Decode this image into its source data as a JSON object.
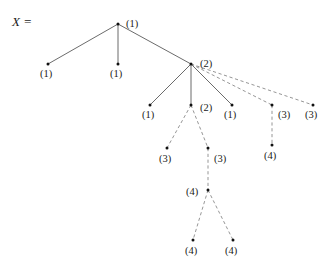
{
  "figure": {
    "equation_label": "X =",
    "background_color": "#ffffff",
    "solid_edge_color": "#5a5a5a",
    "dashed_edge_color": "#8a8a8a",
    "node_dot_color": "#111111",
    "label_color": "#1a1a1a"
  },
  "diagram_data": {
    "type": "tree",
    "description": "Rooted tree with labelled vertices; solid edges and dashed edges",
    "node_labels": [
      "(1)",
      "(1)",
      "(1)",
      "(2)",
      "(1)",
      "(2)",
      "(1)",
      "(3)",
      "(3)",
      "(3)",
      "(3)",
      "(4)",
      "(4)",
      "(4)",
      "(4)"
    ],
    "nodes": [
      {
        "id": "root",
        "label": "(1)",
        "x": 118,
        "y": 24,
        "label_dx": 8,
        "label_dy": 3,
        "depth": 0
      },
      {
        "id": "n1",
        "label": "(1)",
        "x": 48,
        "y": 64,
        "label_dx": -8,
        "label_dy": 13,
        "depth": 1
      },
      {
        "id": "n2",
        "label": "(1)",
        "x": 118,
        "y": 64,
        "label_dx": -8,
        "label_dy": 13,
        "depth": 1
      },
      {
        "id": "n3",
        "label": "(2)",
        "x": 191,
        "y": 64,
        "label_dx": 9,
        "label_dy": 3,
        "depth": 1
      },
      {
        "id": "n4",
        "label": "(1)",
        "x": 150,
        "y": 105,
        "label_dx": -8,
        "label_dy": 13,
        "depth": 2
      },
      {
        "id": "n5",
        "label": "(2)",
        "x": 191,
        "y": 105,
        "label_dx": 9,
        "label_dy": 6,
        "depth": 2
      },
      {
        "id": "n6",
        "label": "(1)",
        "x": 232,
        "y": 105,
        "label_dx": -8,
        "label_dy": 13,
        "depth": 2
      },
      {
        "id": "n7",
        "label": "(3)",
        "x": 272,
        "y": 105,
        "label_dx": 6,
        "label_dy": 13,
        "depth": 2
      },
      {
        "id": "n8",
        "label": "(3)",
        "x": 313,
        "y": 105,
        "label_dx": -8,
        "label_dy": 13,
        "depth": 2
      },
      {
        "id": "n9",
        "label": "(3)",
        "x": 167,
        "y": 148,
        "label_dx": -8,
        "label_dy": 14,
        "depth": 3
      },
      {
        "id": "n10",
        "label": "(3)",
        "x": 208,
        "y": 148,
        "label_dx": 6,
        "label_dy": 14,
        "depth": 3
      },
      {
        "id": "n11",
        "label": "(4)",
        "x": 272,
        "y": 145,
        "label_dx": -8,
        "label_dy": 14,
        "depth": 3
      },
      {
        "id": "n12",
        "label": "(4)",
        "x": 208,
        "y": 190,
        "label_dx": -22,
        "label_dy": 5,
        "depth": 4
      },
      {
        "id": "n13",
        "label": "(4)",
        "x": 193,
        "y": 240,
        "label_dx": -8,
        "label_dy": 14,
        "depth": 5
      },
      {
        "id": "n14",
        "label": "(4)",
        "x": 233,
        "y": 240,
        "label_dx": -8,
        "label_dy": 14,
        "depth": 5
      }
    ],
    "edges": [
      {
        "from": "root",
        "to": "n1",
        "style": "solid"
      },
      {
        "from": "root",
        "to": "n2",
        "style": "solid"
      },
      {
        "from": "root",
        "to": "n3",
        "style": "solid"
      },
      {
        "from": "n3",
        "to": "n4",
        "style": "solid"
      },
      {
        "from": "n3",
        "to": "n5",
        "style": "solid"
      },
      {
        "from": "n3",
        "to": "n6",
        "style": "solid"
      },
      {
        "from": "n3",
        "to": "n7",
        "style": "dashed"
      },
      {
        "from": "n3",
        "to": "n8",
        "style": "dashed"
      },
      {
        "from": "n5",
        "to": "n9",
        "style": "dashed"
      },
      {
        "from": "n5",
        "to": "n10",
        "style": "dashed"
      },
      {
        "from": "n7",
        "to": "n11",
        "style": "dashed"
      },
      {
        "from": "n10",
        "to": "n12",
        "style": "dashed"
      },
      {
        "from": "n12",
        "to": "n13",
        "style": "dashed"
      },
      {
        "from": "n12",
        "to": "n14",
        "style": "dashed"
      }
    ],
    "equation_label_pos": {
      "x": 12,
      "y": 26
    }
  }
}
